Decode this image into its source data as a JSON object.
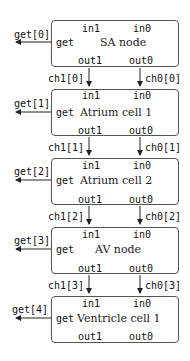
{
  "diagram": {
    "nodes": [
      {
        "title": "SA node",
        "in1": "in1",
        "in0": "in0",
        "out1": "out1",
        "out0": "out0",
        "get": "get",
        "get_label": "get[0]"
      },
      {
        "title": "Atrium cell 1",
        "in1": "in1",
        "in0": "in0",
        "out1": "out1",
        "out0": "out0",
        "get": "get",
        "get_label": "get[1]"
      },
      {
        "title": "Atrium cell 2",
        "in1": "in1",
        "in0": "in0",
        "out1": "out1",
        "out0": "out0",
        "get": "get",
        "get_label": "get[2]"
      },
      {
        "title": "AV node",
        "in1": "in1",
        "in0": "in0",
        "out1": "out1",
        "out0": "out0",
        "get": "get",
        "get_label": "get[3]"
      },
      {
        "title": "Ventricle cell 1",
        "in1": "in1",
        "in0": "in0",
        "out1": "out1",
        "out0": "out0",
        "get": "get",
        "get_label": "get[4]"
      }
    ],
    "channels": [
      {
        "ch1": "ch1[0]",
        "ch0": "ch0[0]"
      },
      {
        "ch1": "ch1[1]",
        "ch0": "ch0[1]"
      },
      {
        "ch1": "ch1[2]",
        "ch0": "ch0[2]"
      },
      {
        "ch1": "ch1[3]",
        "ch0": "ch0[3]"
      }
    ]
  }
}
